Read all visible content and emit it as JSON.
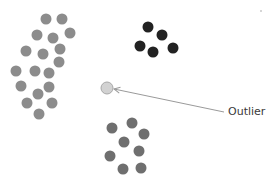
{
  "diagram": {
    "type": "scatter-clusters",
    "annotation": {
      "label": "Outlier",
      "x": 228,
      "y": 106
    },
    "arrow": {
      "from": [
        224,
        112
      ],
      "to": [
        114,
        89
      ],
      "color": "#9a9a9a"
    },
    "outlier": {
      "x": 107,
      "y": 88,
      "r": 6,
      "color": "#d2d2d2",
      "stroke": "#a8a8a8"
    },
    "clusters": [
      {
        "name": "left-cluster",
        "color": "#8c8c8c",
        "r": 5.5,
        "points": [
          [
            46,
            19
          ],
          [
            62,
            19
          ],
          [
            37,
            35
          ],
          [
            53,
            38
          ],
          [
            70,
            33
          ],
          [
            26,
            51
          ],
          [
            43,
            54
          ],
          [
            60,
            49
          ],
          [
            59,
            62
          ],
          [
            16,
            71
          ],
          [
            35,
            71
          ],
          [
            49,
            73
          ],
          [
            21,
            86
          ],
          [
            49,
            87
          ],
          [
            38,
            94
          ],
          [
            27,
            103
          ],
          [
            52,
            103
          ],
          [
            39,
            114
          ]
        ]
      },
      {
        "name": "dark-cluster",
        "color": "#222222",
        "r": 5.5,
        "points": [
          [
            148,
            27
          ],
          [
            162,
            35
          ],
          [
            140,
            46
          ],
          [
            153,
            52
          ],
          [
            173,
            48
          ]
        ]
      },
      {
        "name": "bottom-cluster",
        "color": "#6f6f6f",
        "r": 5.5,
        "points": [
          [
            112,
            128
          ],
          [
            132,
            123
          ],
          [
            144,
            134
          ],
          [
            124,
            142
          ],
          [
            110,
            156
          ],
          [
            139,
            151
          ],
          [
            123,
            169
          ],
          [
            141,
            168
          ]
        ]
      }
    ],
    "speck": {
      "x": 261,
      "y": 11,
      "r": 1,
      "color": "#c8c8c8"
    }
  }
}
